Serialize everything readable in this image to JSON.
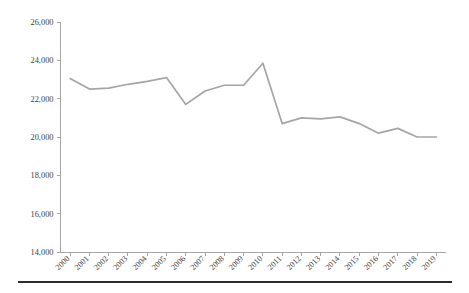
{
  "chart_data": {
    "type": "line",
    "title": "",
    "subtitle": "",
    "xlabel": "",
    "ylabel": "",
    "categories": [
      "2000",
      "2001",
      "2002",
      "2003",
      "2004",
      "2005",
      "2006",
      "2007",
      "2008",
      "2009",
      "2010",
      "2011",
      "2012",
      "2013",
      "2014",
      "2015",
      "2016",
      "2017",
      "2018",
      "2019"
    ],
    "values": [
      23050,
      22500,
      22550,
      22750,
      22900,
      23100,
      21700,
      22400,
      22700,
      22700,
      23850,
      20700,
      21000,
      20950,
      21050,
      20700,
      20200,
      20450,
      20000,
      20000
    ],
    "series": [
      {
        "name": "",
        "values": [
          23050,
          22500,
          22550,
          22750,
          22900,
          23100,
          21700,
          22400,
          22700,
          22700,
          23850,
          20700,
          21000,
          20950,
          21050,
          20700,
          20200,
          20450,
          20000,
          20000
        ]
      }
    ],
    "ylim": [
      14000,
      26000
    ],
    "ytick_values": [
      14000,
      16000,
      18000,
      20000,
      22000,
      24000,
      26000
    ],
    "ytick_labels": [
      "14,000",
      "16,000",
      "18,000",
      "20,000",
      "22,000",
      "24,000",
      "26,000"
    ],
    "ystep": 2000,
    "grid": false,
    "legend": "none",
    "line_color": "#a5a5a5",
    "axis_color": "#a6a6a6",
    "tick_text_color": "#3f3f3f",
    "xtick_rotation": -45,
    "background": "#ffffff"
  },
  "decor": {
    "bottom_rule_color": "#2b2b2b"
  }
}
